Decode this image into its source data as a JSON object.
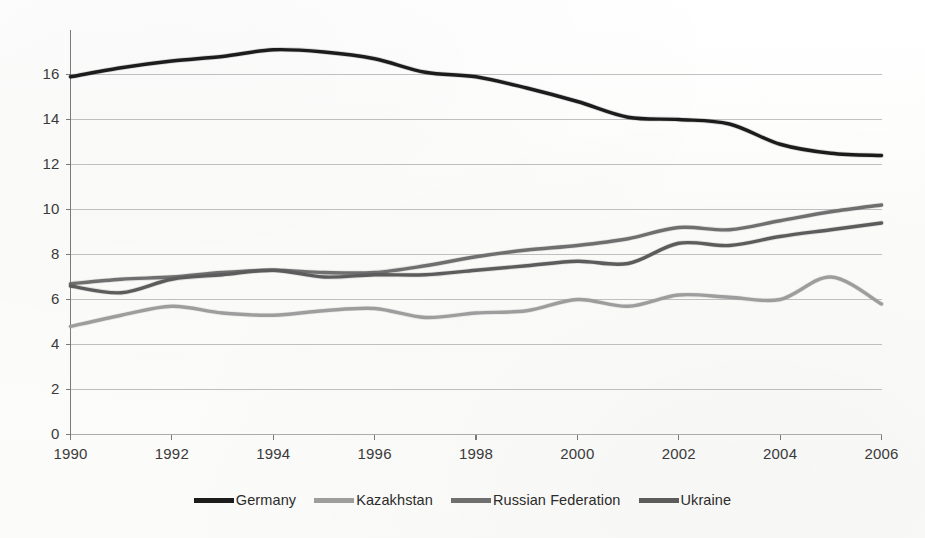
{
  "chart_data": {
    "type": "line",
    "title": "",
    "subtitle": "",
    "xlabel": "",
    "ylabel": "",
    "xlim": [
      1990,
      2006
    ],
    "ylim": [
      0,
      18
    ],
    "grid": true,
    "legend_position": "bottom",
    "x": [
      1990,
      1991,
      1992,
      1993,
      1994,
      1995,
      1996,
      1997,
      1998,
      1999,
      2000,
      2001,
      2002,
      2003,
      2004,
      2005,
      2006
    ],
    "xticks": [
      "1990",
      "1992",
      "1994",
      "1996",
      "1998",
      "2000",
      "2002",
      "2004",
      "2006"
    ],
    "xtick_values": [
      1990,
      1992,
      1994,
      1996,
      1998,
      2000,
      2002,
      2004,
      2006
    ],
    "yticks": [
      "0",
      "2",
      "4",
      "6",
      "8",
      "10",
      "12",
      "14",
      "16"
    ],
    "ytick_values": [
      0,
      2,
      4,
      6,
      8,
      10,
      12,
      14,
      16
    ],
    "series": [
      {
        "name": "Germany",
        "color": "#1c1c1c",
        "width": 3.4,
        "values": [
          15.9,
          16.3,
          16.6,
          16.8,
          17.1,
          17.0,
          16.7,
          16.1,
          15.9,
          15.4,
          14.8,
          14.1,
          14.0,
          13.8,
          12.9,
          12.5,
          12.4
        ]
      },
      {
        "name": "Kazakhstan",
        "color": "#9d9d9d",
        "width": 3.4,
        "values": [
          4.8,
          5.3,
          5.7,
          5.4,
          5.3,
          5.5,
          5.6,
          5.2,
          5.4,
          5.5,
          6.0,
          5.7,
          6.2,
          6.1,
          6.0,
          7.0,
          5.8
        ]
      },
      {
        "name": "Russian Federation",
        "color": "#6f6f6f",
        "width": 3.4,
        "values": [
          6.7,
          6.9,
          7.0,
          7.2,
          7.3,
          7.2,
          7.2,
          7.5,
          7.9,
          8.2,
          8.4,
          8.7,
          9.2,
          9.1,
          9.5,
          9.9,
          10.2
        ]
      },
      {
        "name": "Ukraine",
        "color": "#5c5c5c",
        "width": 3.4,
        "values": [
          6.6,
          6.3,
          6.9,
          7.1,
          7.3,
          7.0,
          7.1,
          7.1,
          7.3,
          7.5,
          7.7,
          7.6,
          8.5,
          8.4,
          8.8,
          9.1,
          9.4
        ]
      }
    ]
  },
  "legend": {
    "items": [
      {
        "label": "Germany",
        "color": "#1c1c1c"
      },
      {
        "label": "Kazakhstan",
        "color": "#9d9d9d"
      },
      {
        "label": "Russian Federation",
        "color": "#6f6f6f"
      },
      {
        "label": "Ukraine",
        "color": "#5c5c5c"
      }
    ]
  },
  "axes": {
    "y_labels": [
      "16",
      "14",
      "12",
      "10",
      "8",
      "6",
      "4",
      "2",
      "0"
    ],
    "x_labels": [
      "1990",
      "1992",
      "1994",
      "1996",
      "1998",
      "2000",
      "2002",
      "2004",
      "2006"
    ]
  },
  "colors": {
    "background": "#fdfdfc",
    "gridline": "#a8a8a8",
    "axis": "#7a7a7a",
    "text": "#2b2b2b"
  }
}
